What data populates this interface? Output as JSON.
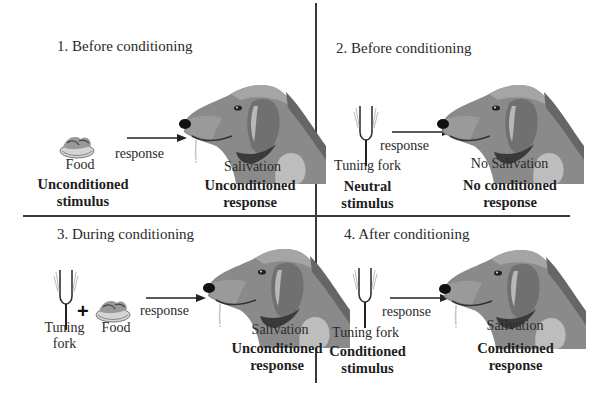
{
  "diagram": {
    "type": "classical-conditioning",
    "panels": [
      {
        "id": 1,
        "title": "1. Before conditioning",
        "stimulus_items": [
          "Food"
        ],
        "stimulus_label": "Food",
        "stimulus_type_line1": "Unconditioned",
        "stimulus_type_line2": "stimulus",
        "arrow_label": "response",
        "response_label": "Salivation",
        "response_type_line1": "Unconditioned",
        "response_type_line2": "response",
        "dog_drooling": true
      },
      {
        "id": 2,
        "title": "2. Before conditioning",
        "stimulus_items": [
          "Tuning fork"
        ],
        "stimulus_label": "Tuning fork",
        "stimulus_type_line1": "Neutral",
        "stimulus_type_line2": "stimulus",
        "arrow_label": "response",
        "response_label": "No Salivation",
        "response_type_line1": "No conditioned",
        "response_type_line2": "response",
        "dog_drooling": false
      },
      {
        "id": 3,
        "title": "3. During conditioning",
        "stimulus_items": [
          "Tuning fork",
          "Food"
        ],
        "stimulus_label_1_line1": "Tuning",
        "stimulus_label_1_line2": "fork",
        "plus": "+",
        "stimulus_label_2": "Food",
        "arrow_label": "response",
        "response_label": "Salivation",
        "response_type_line1": "Unconditioned",
        "response_type_line2": "response",
        "dog_drooling": true
      },
      {
        "id": 4,
        "title": "4. After conditioning",
        "stimulus_items": [
          "Tuning fork"
        ],
        "stimulus_label": "Tuning fork",
        "stimulus_type_line1": "Conditioned",
        "stimulus_type_line2": "stimulus",
        "arrow_label": "response",
        "response_label": "Salivation",
        "response_type_line1": "Conditioned",
        "response_type_line2": "response",
        "dog_drooling": true
      }
    ],
    "colors": {
      "divider": "#3a3a3a",
      "dog_base": "#8a8a8a",
      "dog_dark": "#5a5a5a",
      "dog_light": "#b4b4b4",
      "text": "#2a2a2a"
    }
  }
}
